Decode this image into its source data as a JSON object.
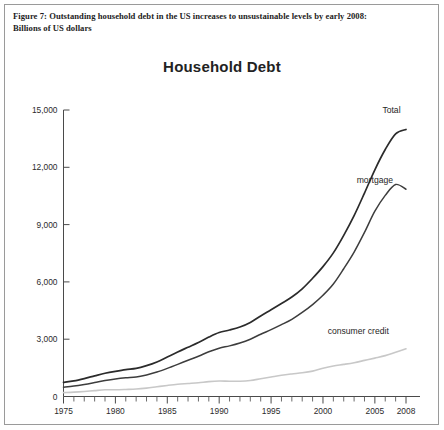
{
  "figure": {
    "caption_line1": "Figure 7: Outstanding household debt in the US increases to unsustainable levels by early 2008:",
    "caption_line2": "Billions of US dollars"
  },
  "chart_data": {
    "type": "line",
    "title": "Household Debt",
    "xlabel": "",
    "ylabel": "",
    "xlim": [
      1975,
      2008
    ],
    "ylim": [
      0,
      15000
    ],
    "yticks": [
      0,
      3000,
      6000,
      9000,
      12000,
      15000
    ],
    "ytick_labels": [
      "0",
      "3,000",
      "6,000",
      "9,000",
      "12,000",
      "15,000"
    ],
    "xticks": [
      1975,
      1980,
      1985,
      1990,
      1995,
      2000,
      2005,
      2008
    ],
    "xtick_labels": [
      "1975",
      "1980",
      "1985",
      "1990",
      "1995",
      "2000",
      "2005",
      "2008"
    ],
    "x_minor_tick_interval": 1,
    "grid": false,
    "legend_position": "inline-right",
    "units": "Billions of US dollars",
    "x": [
      1975,
      1976,
      1977,
      1978,
      1979,
      1980,
      1981,
      1982,
      1983,
      1984,
      1985,
      1986,
      1987,
      1988,
      1989,
      1990,
      1991,
      1992,
      1993,
      1994,
      1995,
      1996,
      1997,
      1998,
      1999,
      2000,
      2001,
      2002,
      2003,
      2004,
      2005,
      2006,
      2007,
      2008
    ],
    "series": [
      {
        "name": "Total",
        "label": "Total",
        "color": "#2b2b2b",
        "width": 1.7,
        "values": [
          736,
          820,
          940,
          1080,
          1215,
          1320,
          1410,
          1470,
          1615,
          1810,
          2070,
          2330,
          2580,
          2830,
          3110,
          3350,
          3480,
          3640,
          3880,
          4220,
          4540,
          4870,
          5210,
          5640,
          6190,
          6800,
          7520,
          8440,
          9470,
          10650,
          11870,
          12930,
          13750,
          13980
        ]
      },
      {
        "name": "mortgage",
        "label": "mortgage",
        "color": "#3d3d3d",
        "width": 1.5,
        "values": [
          490,
          545,
          630,
          730,
          835,
          920,
          980,
          1020,
          1130,
          1280,
          1470,
          1680,
          1900,
          2110,
          2340,
          2530,
          2650,
          2800,
          3000,
          3260,
          3500,
          3760,
          4040,
          4400,
          4810,
          5300,
          5890,
          6690,
          7560,
          8590,
          9700,
          10530,
          11100,
          10850
        ]
      },
      {
        "name": "consumer credit",
        "label": "consumer credit",
        "color": "#c8c8c8",
        "width": 1.6,
        "values": [
          205,
          230,
          265,
          310,
          350,
          355,
          370,
          390,
          440,
          510,
          580,
          640,
          680,
          720,
          780,
          810,
          800,
          800,
          840,
          930,
          1020,
          1110,
          1180,
          1240,
          1330,
          1480,
          1600,
          1680,
          1770,
          1890,
          2010,
          2140,
          2320,
          2500
        ]
      }
    ],
    "annotations": [
      {
        "text": "Total",
        "x": 2006.6,
        "y": 14850,
        "anchor": "middle"
      },
      {
        "text": "mortgage",
        "x": 2005.0,
        "y": 11180,
        "anchor": "middle"
      },
      {
        "text": "consumer credit",
        "x": 2003.4,
        "y": 3280,
        "anchor": "middle"
      }
    ]
  }
}
